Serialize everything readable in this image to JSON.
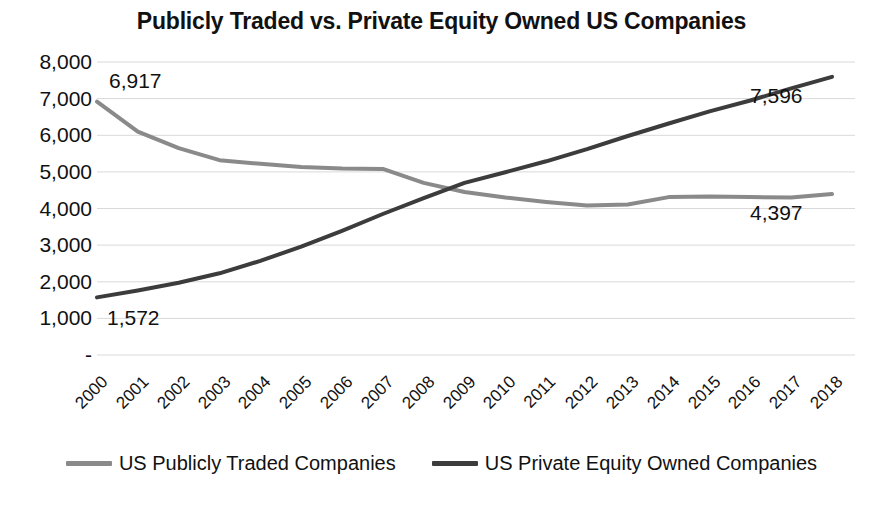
{
  "chart_data": {
    "type": "line",
    "title": "Publicly Traded vs. Private Equity Owned US Companies",
    "xlabel": "",
    "ylabel": "",
    "ylim": [
      0,
      8000
    ],
    "ytick_labels": [
      "8,000",
      "7,000",
      "6,000",
      "5,000",
      "4,000",
      "3,000",
      "2,000",
      "1,000",
      "-"
    ],
    "ytick_values": [
      8000,
      7000,
      6000,
      5000,
      4000,
      3000,
      2000,
      1000,
      0
    ],
    "grid": true,
    "grid_axis": "y",
    "legend_position": "bottom",
    "categories": [
      "2000",
      "2001",
      "2002",
      "2003",
      "2004",
      "2005",
      "2006",
      "2007",
      "2008",
      "2009",
      "2010",
      "2011",
      "2012",
      "2013",
      "2014",
      "2015",
      "2016",
      "2017",
      "2018"
    ],
    "series": [
      {
        "name": "US Publicly Traded Companies",
        "color": "#8a8a8a",
        "values": [
          6917,
          6100,
          5650,
          5320,
          5220,
          5130,
          5090,
          5080,
          4700,
          4450,
          4300,
          4180,
          4080,
          4110,
          4310,
          4330,
          4310,
          4300,
          4397
        ]
      },
      {
        "name": "US Private Equity Owned Companies",
        "color": "#3c3c3c",
        "values": [
          1572,
          1760,
          1970,
          2230,
          2570,
          2960,
          3390,
          3850,
          4280,
          4700,
          4990,
          5290,
          5620,
          5980,
          6320,
          6650,
          6950,
          7280,
          7596
        ]
      }
    ],
    "annotations": [
      {
        "text": "6,917",
        "series": "US Publicly Traded Companies",
        "category": "2000",
        "value": 6917,
        "position": "above-right"
      },
      {
        "text": "1,572",
        "series": "US Private Equity Owned Companies",
        "category": "2000",
        "value": 1572,
        "position": "below-right"
      },
      {
        "text": "7,596",
        "series": "US Private Equity Owned Companies",
        "category": "2018",
        "value": 7596,
        "position": "below-left"
      },
      {
        "text": "4,397",
        "series": "US Publicly Traded Companies",
        "category": "2018",
        "value": 4397,
        "position": "below-left"
      }
    ]
  },
  "colors": {
    "publicly_traded": "#8a8a8a",
    "private_equity": "#3c3c3c",
    "gridline": "#d9d9d9",
    "text": "#111111",
    "background": "#ffffff"
  },
  "legend": {
    "items": [
      {
        "label": "US Publicly Traded Companies",
        "color": "#8a8a8a"
      },
      {
        "label": "US Private Equity Owned Companies",
        "color": "#3c3c3c"
      }
    ]
  }
}
